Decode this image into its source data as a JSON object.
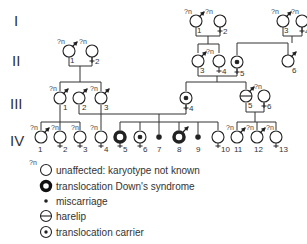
{
  "generations": [
    "I",
    "II",
    "III",
    "IV"
  ],
  "individuals": {
    "I1": {
      "num": "1",
      "sex": "male",
      "status": "unknown",
      "qn": "?n"
    },
    "I2": {
      "num": "2",
      "sex": "female",
      "status": "unknown",
      "qn": "?n"
    },
    "I3": {
      "num": "3",
      "sex": "male",
      "status": "unknown",
      "qn": "?n"
    },
    "I4": {
      "num": "4",
      "sex": "female",
      "status": "unknown",
      "qn": "?n"
    },
    "II1": {
      "num": "1",
      "sex": "male",
      "status": "unknown",
      "qn": "?n"
    },
    "II2": {
      "num": "2",
      "sex": "female",
      "status": "unknown",
      "qn": "?n"
    },
    "II3": {
      "num": "3",
      "sex": "male",
      "status": "unaffected"
    },
    "II4": {
      "num": "4",
      "sex": "female",
      "status": "unknown",
      "qn": "?n"
    },
    "II5": {
      "num": "5",
      "sex": "female",
      "status": "carrier"
    },
    "II6": {
      "num": "6",
      "sex": "male",
      "status": "unaffected"
    },
    "III1": {
      "num": "1",
      "sex": "male",
      "status": "unknown",
      "qn": "?n"
    },
    "III2": {
      "num": "2",
      "sex": "male",
      "status": "unaffected"
    },
    "III3": {
      "num": "3",
      "sex": "male",
      "status": "unknown",
      "qn": "?n"
    },
    "III4": {
      "num": "4",
      "sex": "female",
      "status": "carrier"
    },
    "III5": {
      "num": "5",
      "sex": "male",
      "status": "harelip",
      "qn": "?n"
    },
    "III6": {
      "num": "6",
      "sex": "female",
      "status": "unaffected"
    },
    "IV1": {
      "num": "1",
      "sex": "male",
      "status": "unknown",
      "qn": "?n"
    },
    "IV2": {
      "num": "2",
      "sex": "female",
      "status": "unknown",
      "qn": "?n"
    },
    "IV3": {
      "num": "3",
      "sex": "female",
      "status": "unknown",
      "qn": "?n"
    },
    "IV4": {
      "num": "4",
      "sex": "female",
      "status": "unknown",
      "qn": "?n"
    },
    "IV5": {
      "num": "5",
      "sex": "female",
      "status": "downs"
    },
    "IV6": {
      "num": "6",
      "sex": "female",
      "status": "carrier"
    },
    "IV7": {
      "num": "7",
      "sex": "unknown",
      "status": "miscarriage"
    },
    "IV8": {
      "num": "8",
      "sex": "male",
      "status": "downs"
    },
    "IV9": {
      "num": "9",
      "sex": "unknown",
      "status": "miscarriage"
    },
    "IV10": {
      "num": "10",
      "sex": "female",
      "status": "unaffected"
    },
    "IV11": {
      "num": "11",
      "sex": "male",
      "status": "unknown",
      "qn": "?n"
    },
    "IV12": {
      "num": "12",
      "sex": "male",
      "status": "unknown",
      "qn": "?n"
    },
    "IV13": {
      "num": "13",
      "sex": "female",
      "status": "unknown",
      "qn": "?n"
    }
  },
  "legend": {
    "qn_marker": "?n",
    "items": [
      {
        "symbol": "unaffected-circle",
        "label": "unaffected: karyotype not known"
      },
      {
        "symbol": "thick-ring",
        "label": "translocation Down's syndrome"
      },
      {
        "symbol": "dot",
        "label": "miscarriage"
      },
      {
        "symbol": "circle-bar",
        "label": "harelip"
      },
      {
        "symbol": "circle-dot",
        "label": "translocation carrier"
      }
    ]
  }
}
